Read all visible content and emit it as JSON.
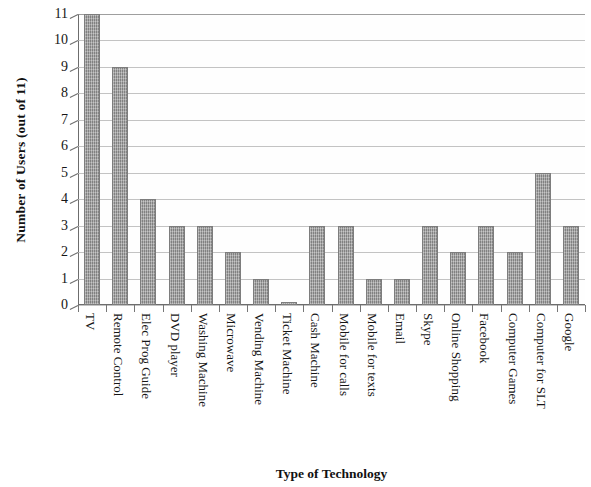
{
  "chart_data": {
    "type": "bar",
    "title": "",
    "xlabel": "Type of Technology",
    "ylabel": "Number of Users (out of 11)",
    "ylim": [
      0,
      11
    ],
    "ytick_labels": [
      "11",
      "10",
      "9",
      "8",
      "7",
      "6",
      "5",
      "4",
      "3",
      "2",
      "1",
      "0"
    ],
    "yticks": [
      11,
      10,
      9,
      8,
      7,
      6,
      5,
      4,
      3,
      2,
      1,
      0
    ],
    "grid": true,
    "legend": false,
    "bar_color": "#9c9c9c",
    "categories": [
      "TV",
      "Remote Control",
      "Elec Prog Guide",
      "DVD player",
      "Washing Machine",
      "Microwave",
      "Vending Machine",
      "Ticket Machine",
      "Cash Machine",
      "Mobile for calls",
      "Mobile for texts",
      "Email",
      "Skype",
      "Online Shopping",
      "Facebook",
      "Computer Games",
      "Computer for SLT",
      "Google"
    ],
    "values": [
      11,
      9,
      4,
      3,
      3,
      2,
      1,
      0.1,
      3,
      3,
      1,
      1,
      3,
      2,
      3,
      2,
      5,
      3
    ]
  }
}
